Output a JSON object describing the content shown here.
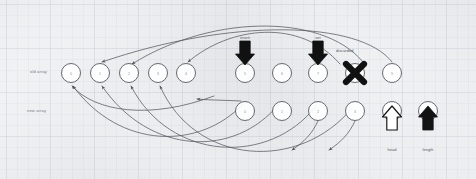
{
  "diagram": {
    "background": "#fdfdfd",
    "ink_color": "#4a4f57",
    "accent_color": "#111111",
    "row_labels": [
      {
        "id": "row-top",
        "text": "old array",
        "x": 30,
        "y": 69
      },
      {
        "id": "row-bottom",
        "text": "new array",
        "x": 27,
        "y": 108
      }
    ],
    "top_row_nodes": [
      {
        "id": "t0",
        "cx": 71,
        "cy": 73,
        "r": 9.5,
        "glyph": "0"
      },
      {
        "id": "t1",
        "cx": 100,
        "cy": 73,
        "r": 9.5,
        "glyph": "1"
      },
      {
        "id": "t2",
        "cx": 129,
        "cy": 73,
        "r": 9.5,
        "glyph": "2"
      },
      {
        "id": "t3",
        "cx": 158,
        "cy": 73,
        "r": 9.5,
        "glyph": "3"
      },
      {
        "id": "t4",
        "cx": 186,
        "cy": 73,
        "r": 9.5,
        "glyph": "4"
      },
      {
        "id": "t5",
        "cx": 245,
        "cy": 73,
        "r": 9.5,
        "glyph": "5"
      },
      {
        "id": "t6",
        "cx": 282,
        "cy": 73,
        "r": 9.5,
        "glyph": "6"
      },
      {
        "id": "t7",
        "cx": 318,
        "cy": 73,
        "r": 9.5,
        "glyph": "7"
      },
      {
        "id": "t8",
        "cx": 355,
        "cy": 73,
        "r": 9.5,
        "glyph": "8"
      },
      {
        "id": "t9",
        "cx": 392,
        "cy": 73,
        "r": 9.5,
        "glyph": "9"
      }
    ],
    "bottom_row_nodes": [
      {
        "id": "b0",
        "cx": 245,
        "cy": 111,
        "r": 9.5,
        "glyph": "0"
      },
      {
        "id": "b1",
        "cx": 282,
        "cy": 111,
        "r": 9.5,
        "glyph": "1"
      },
      {
        "id": "b2",
        "cx": 318,
        "cy": 111,
        "r": 9.5,
        "glyph": "2"
      },
      {
        "id": "b3",
        "cx": 355,
        "cy": 111,
        "r": 9.5,
        "glyph": "3"
      },
      {
        "id": "b4",
        "cx": 392,
        "cy": 111,
        "r": 9.5,
        "glyph": "4"
      },
      {
        "id": "b5",
        "cx": 428,
        "cy": 111,
        "r": 9.5,
        "glyph": "5"
      }
    ],
    "marks": [
      {
        "id": "x-mark",
        "type": "x-cross",
        "cx": 355,
        "cy": 73,
        "size": 9,
        "color": "#111111"
      }
    ],
    "block_arrows": [
      {
        "id": "arrow-down-1",
        "direction": "down",
        "style": "filled",
        "x": 245,
        "y": 41,
        "label": "insert",
        "label_x": 245,
        "label_y": 36
      },
      {
        "id": "arrow-down-2",
        "direction": "down",
        "style": "filled",
        "x": 318,
        "y": 41,
        "label": "set",
        "label_x": 318,
        "label_y": 36
      },
      {
        "id": "arrow-up-1",
        "direction": "up",
        "style": "hollow",
        "x": 392,
        "y": 130,
        "label": "head",
        "label_x": 392,
        "label_y": 148
      },
      {
        "id": "arrow-up-2",
        "direction": "up",
        "style": "filled",
        "x": 428,
        "y": 130,
        "label": "length",
        "label_x": 428,
        "label_y": 148
      }
    ],
    "annotations": [
      {
        "id": "x-annotation",
        "text": "discarded",
        "x": 336,
        "y": 49
      }
    ],
    "edge_count": 11
  }
}
